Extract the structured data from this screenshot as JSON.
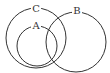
{
  "diagram": {
    "type": "venn",
    "sets": [
      {
        "id": "C",
        "label": "C",
        "cx": 36,
        "cy": 38,
        "r": 30,
        "label_x": 36,
        "label_y": 9
      },
      {
        "id": "B",
        "label": "B",
        "cx": 76,
        "cy": 42,
        "r": 30,
        "label_x": 77,
        "label_y": 11
      },
      {
        "id": "A",
        "label": "A",
        "cx": 37,
        "cy": 46,
        "r": 20,
        "label_x": 36,
        "label_y": 26
      }
    ],
    "relations": [
      "A is a subset of C",
      "A overlaps B",
      "C overlaps B"
    ]
  }
}
